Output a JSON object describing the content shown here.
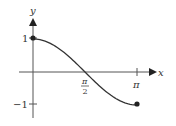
{
  "chart_data": {
    "type": "line",
    "title": "",
    "function": "y = cos(x)",
    "xlabel": "x",
    "ylabel": "y",
    "xlim": [
      0,
      3.14159
    ],
    "ylim": [
      -1,
      1
    ],
    "x_ticks": [
      {
        "value": 1.5708,
        "label_num": "π",
        "label_den": "2"
      },
      {
        "value": 3.14159,
        "label": "π"
      }
    ],
    "y_ticks": [
      {
        "value": 1,
        "label": "1"
      },
      {
        "value": -1,
        "label": "−1"
      }
    ],
    "series": [
      {
        "name": "cos x",
        "x": [
          0,
          0.3927,
          0.7854,
          1.1781,
          1.5708,
          1.9635,
          2.3562,
          2.7489,
          3.14159
        ],
        "y": [
          1,
          0.924,
          0.707,
          0.383,
          0,
          -0.383,
          -0.707,
          -0.924,
          -1
        ]
      }
    ],
    "endpoints": [
      {
        "x": 0,
        "y": 1,
        "marker": "filled-dot"
      },
      {
        "x": 3.14159,
        "y": -1,
        "marker": "filled-dot"
      }
    ],
    "grid": false,
    "legend": "none",
    "colors": {
      "axis": "#444444",
      "curve": "#333333"
    }
  },
  "labels": {
    "x_axis": "x",
    "y_axis": "y",
    "y_tick_pos": "1",
    "y_tick_neg": "−1",
    "x_tick_half_pi_num": "π",
    "x_tick_half_pi_den": "2",
    "x_tick_pi": "π"
  }
}
